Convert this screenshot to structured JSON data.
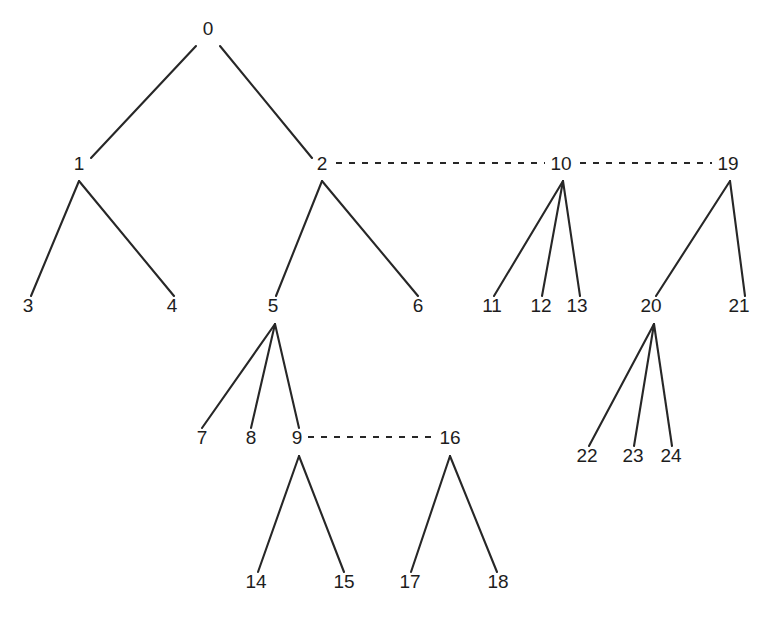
{
  "diagram": {
    "kind": "tree-diagram",
    "title": "",
    "background_color": "#ffffff",
    "edge_color": "#272727",
    "label_color": "#1d1d1d",
    "solid_edge_style": "solid",
    "dashed_edge_style": "dashed",
    "node_count": 25,
    "nodes": [
      {
        "id": "n0",
        "label": "0",
        "x": 208,
        "y": 35,
        "anchor_x": 208,
        "anchor_y": 46
      },
      {
        "id": "n1",
        "label": "1",
        "x": 79,
        "y": 170,
        "anchor_x": 79,
        "anchor_y": 181
      },
      {
        "id": "n2",
        "label": "2",
        "x": 322,
        "y": 170,
        "anchor_x": 322,
        "anchor_y": 181
      },
      {
        "id": "n3",
        "label": "3",
        "x": 28,
        "y": 312,
        "anchor_x": 28,
        "anchor_y": 296
      },
      {
        "id": "n4",
        "label": "4",
        "x": 172,
        "y": 312,
        "anchor_x": 172,
        "anchor_y": 296
      },
      {
        "id": "n5",
        "label": "5",
        "x": 273,
        "y": 312,
        "anchor_x": 275,
        "anchor_y": 324
      },
      {
        "id": "n6",
        "label": "6",
        "x": 418,
        "y": 312,
        "anchor_x": 418,
        "anchor_y": 296
      },
      {
        "id": "n7",
        "label": "7",
        "x": 202,
        "y": 444,
        "anchor_x": 202,
        "anchor_y": 428
      },
      {
        "id": "n8",
        "label": "8",
        "x": 251,
        "y": 444,
        "anchor_x": 251,
        "anchor_y": 428
      },
      {
        "id": "n9",
        "label": "9",
        "x": 297,
        "y": 444,
        "anchor_x": 299,
        "anchor_y": 456
      },
      {
        "id": "n10",
        "label": "10",
        "x": 561,
        "y": 170,
        "anchor_x": 563,
        "anchor_y": 181
      },
      {
        "id": "n11",
        "label": "11",
        "x": 492,
        "y": 312,
        "anchor_x": 494,
        "anchor_y": 296
      },
      {
        "id": "n12",
        "label": "12",
        "x": 541,
        "y": 312,
        "anchor_x": 542,
        "anchor_y": 296
      },
      {
        "id": "n13",
        "label": "13",
        "x": 577,
        "y": 312,
        "anchor_x": 580,
        "anchor_y": 296
      },
      {
        "id": "n14",
        "label": "14",
        "x": 256,
        "y": 588,
        "anchor_x": 258,
        "anchor_y": 572
      },
      {
        "id": "n15",
        "label": "15",
        "x": 344,
        "y": 588,
        "anchor_x": 344,
        "anchor_y": 572
      },
      {
        "id": "n16",
        "label": "16",
        "x": 450,
        "y": 444,
        "anchor_x": 450,
        "anchor_y": 456
      },
      {
        "id": "n17",
        "label": "17",
        "x": 410,
        "y": 588,
        "anchor_x": 411,
        "anchor_y": 572
      },
      {
        "id": "n18",
        "label": "18",
        "x": 498,
        "y": 588,
        "anchor_x": 497,
        "anchor_y": 572
      },
      {
        "id": "n19",
        "label": "19",
        "x": 728,
        "y": 170,
        "anchor_x": 730,
        "anchor_y": 181
      },
      {
        "id": "n20",
        "label": "20",
        "x": 651,
        "y": 312,
        "anchor_x": 654,
        "anchor_y": 324
      },
      {
        "id": "n21",
        "label": "21",
        "x": 739,
        "y": 312,
        "anchor_x": 744,
        "anchor_y": 296
      },
      {
        "id": "n22",
        "label": "22",
        "x": 587,
        "y": 462,
        "anchor_x": 589,
        "anchor_y": 446
      },
      {
        "id": "n23",
        "label": "23",
        "x": 633,
        "y": 462,
        "anchor_x": 634,
        "anchor_y": 446
      },
      {
        "id": "n24",
        "label": "24",
        "x": 671,
        "y": 462,
        "anchor_x": 672,
        "anchor_y": 446
      }
    ],
    "edges": [
      {
        "from": "0",
        "to": "1",
        "style": "solid",
        "x1": 196,
        "y1": 46,
        "x2": 91,
        "y2": 158
      },
      {
        "from": "0",
        "to": "2",
        "style": "solid",
        "x1": 220,
        "y1": 46,
        "x2": 312,
        "y2": 158
      },
      {
        "from": "1",
        "to": "3",
        "style": "solid",
        "x1": 79,
        "y1": 181,
        "x2": 31,
        "y2": 296
      },
      {
        "from": "1",
        "to": "4",
        "style": "solid",
        "x1": 79,
        "y1": 181,
        "x2": 174,
        "y2": 296
      },
      {
        "from": "2",
        "to": "5",
        "style": "solid",
        "x1": 322,
        "y1": 181,
        "x2": 276,
        "y2": 296
      },
      {
        "from": "2",
        "to": "6",
        "style": "solid",
        "x1": 322,
        "y1": 181,
        "x2": 418,
        "y2": 296
      },
      {
        "from": "5",
        "to": "7",
        "style": "solid",
        "x1": 275,
        "y1": 324,
        "x2": 202,
        "y2": 428
      },
      {
        "from": "5",
        "to": "8",
        "style": "solid",
        "x1": 275,
        "y1": 324,
        "x2": 251,
        "y2": 428
      },
      {
        "from": "5",
        "to": "9",
        "style": "solid",
        "x1": 275,
        "y1": 324,
        "x2": 299,
        "y2": 428
      },
      {
        "from": "9",
        "to": "14",
        "style": "solid",
        "x1": 299,
        "y1": 456,
        "x2": 258,
        "y2": 572
      },
      {
        "from": "9",
        "to": "15",
        "style": "solid",
        "x1": 299,
        "y1": 456,
        "x2": 344,
        "y2": 572
      },
      {
        "from": "16",
        "to": "17",
        "style": "solid",
        "x1": 450,
        "y1": 456,
        "x2": 411,
        "y2": 572
      },
      {
        "from": "16",
        "to": "18",
        "style": "solid",
        "x1": 450,
        "y1": 456,
        "x2": 497,
        "y2": 572
      },
      {
        "from": "10",
        "to": "11",
        "style": "solid",
        "x1": 563,
        "y1": 181,
        "x2": 494,
        "y2": 296
      },
      {
        "from": "10",
        "to": "12",
        "style": "solid",
        "x1": 563,
        "y1": 181,
        "x2": 542,
        "y2": 296
      },
      {
        "from": "10",
        "to": "13",
        "style": "solid",
        "x1": 563,
        "y1": 181,
        "x2": 580,
        "y2": 296
      },
      {
        "from": "19",
        "to": "20",
        "style": "solid",
        "x1": 730,
        "y1": 181,
        "x2": 656,
        "y2": 296
      },
      {
        "from": "19",
        "to": "21",
        "style": "solid",
        "x1": 730,
        "y1": 181,
        "x2": 745,
        "y2": 296
      },
      {
        "from": "20",
        "to": "22",
        "style": "solid",
        "x1": 654,
        "y1": 324,
        "x2": 589,
        "y2": 446
      },
      {
        "from": "20",
        "to": "23",
        "style": "solid",
        "x1": 654,
        "y1": 324,
        "x2": 634,
        "y2": 446
      },
      {
        "from": "20",
        "to": "24",
        "style": "solid",
        "x1": 654,
        "y1": 324,
        "x2": 672,
        "y2": 446
      },
      {
        "from": "2",
        "to": "10",
        "style": "dashed",
        "x1": 336,
        "y1": 163,
        "x2": 545,
        "y2": 163
      },
      {
        "from": "10",
        "to": "19",
        "style": "dashed",
        "x1": 580,
        "y1": 163,
        "x2": 712,
        "y2": 163
      },
      {
        "from": "9",
        "to": "16",
        "style": "dashed",
        "x1": 308,
        "y1": 437,
        "x2": 435,
        "y2": 437
      }
    ]
  }
}
